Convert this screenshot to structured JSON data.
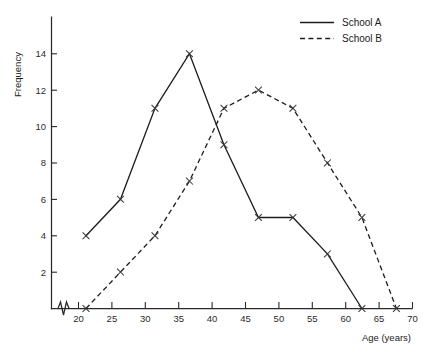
{
  "chart_data": {
    "type": "line",
    "title": "",
    "xlabel": "Age (years)",
    "ylabel": "Frequency",
    "xlim": [
      17.5,
      71.5
    ],
    "ylim": [
      0,
      15.2
    ],
    "xticks": [
      20,
      25,
      30,
      35,
      40,
      45,
      50,
      55,
      60,
      65,
      70
    ],
    "yticks": [
      2,
      4,
      6,
      8,
      10,
      12,
      14
    ],
    "grid": false,
    "axis_break_x": true,
    "marker": "x",
    "legend_position": "top-right",
    "x": [
      22.5,
      27.5,
      32.5,
      37.5,
      42.5,
      47.5,
      52.5,
      57.5,
      62.5,
      67.5
    ],
    "series": [
      {
        "name": "School A",
        "style": "solid",
        "x": [
          22.5,
          27.5,
          32.5,
          37.5,
          42.5,
          47.5,
          52.5,
          57.5,
          62.5
        ],
        "values": [
          4,
          6,
          11,
          14,
          9,
          5,
          5,
          3,
          0
        ]
      },
      {
        "name": "School B",
        "style": "dashed",
        "x": [
          22.5,
          27.5,
          32.5,
          37.5,
          42.5,
          47.5,
          52.5,
          57.5,
          62.5,
          67.5
        ],
        "values": [
          0,
          2,
          4,
          7,
          11,
          12,
          11,
          8,
          5,
          0
        ]
      }
    ]
  },
  "axes": {
    "y_title": "Frequency",
    "x_title": "Age (years)",
    "xtick_labels": [
      "20",
      "25",
      "30",
      "35",
      "40",
      "45",
      "50",
      "55",
      "60",
      "65",
      "70"
    ],
    "ytick_labels": [
      "2",
      "4",
      "6",
      "8",
      "10",
      "12",
      "14"
    ]
  },
  "legend": {
    "entries": [
      {
        "label": "School A",
        "style": "solid"
      },
      {
        "label": "School B",
        "style": "dashed"
      }
    ]
  },
  "edge_text": {
    "top": "",
    "bottom": ""
  }
}
